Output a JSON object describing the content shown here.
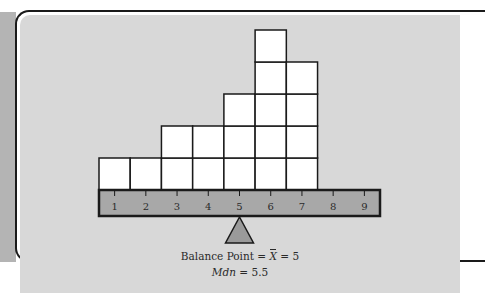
{
  "figure": {
    "caption_line1": {
      "label": "Balance Point",
      "eq1": "=",
      "symbol": "X",
      "eq2": "=",
      "value": "5"
    },
    "caption_line2": {
      "label": "Mdn",
      "eq": "=",
      "value": "5.5"
    },
    "colors": {
      "panel_bg": "#d8d8d8",
      "block_fill": "#ffffff",
      "beam_fill": "#a8a8a8",
      "fulcrum_fill": "#9a9a9a",
      "outline": "#1a1a1a"
    }
  },
  "chart_data": {
    "type": "bar",
    "title": "",
    "xlabel": "",
    "ylabel": "",
    "categories": [
      "1",
      "2",
      "3",
      "4",
      "5",
      "6",
      "7",
      "8",
      "9"
    ],
    "values": [
      1,
      1,
      2,
      2,
      3,
      5,
      4,
      0,
      0
    ],
    "representation": "stacked unit blocks on a balance beam",
    "annotations": [
      "Balance Point = X̄ = 5",
      "Mdn = 5.5"
    ],
    "fulcrum_at": 5,
    "grid": false
  }
}
